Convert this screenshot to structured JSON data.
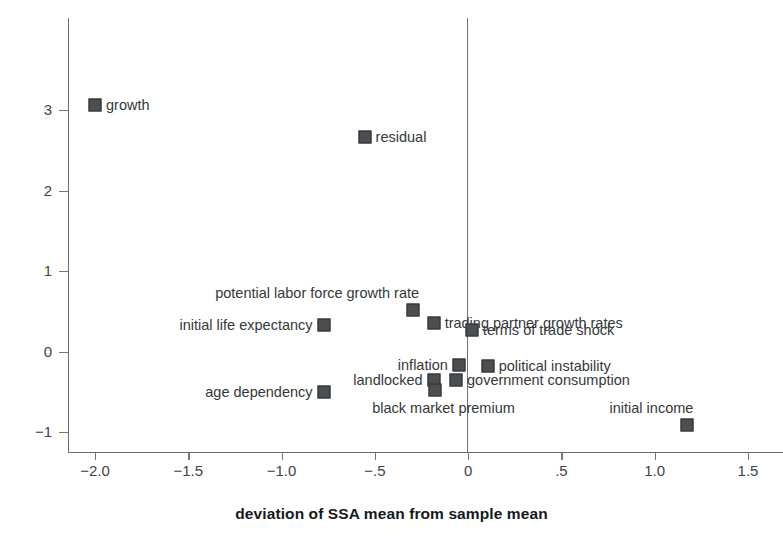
{
  "chart_data": {
    "type": "scatter",
    "title": "",
    "xlabel": "deviation of SSA mean from sample mean",
    "ylabel": "",
    "xlim": [
      -2.2,
      1.6
    ],
    "ylim": [
      -1.35,
      3.45
    ],
    "grid": false,
    "legend": "none",
    "xticks": [
      -2.0,
      -1.5,
      -1.0,
      -0.5,
      0,
      0.5,
      1.0,
      1.5
    ],
    "xticklabels": [
      "-2.0",
      "-1.5",
      "-1.0",
      "-.5",
      "0",
      ".5",
      "1.0",
      "1.5"
    ],
    "yticks": [
      3,
      2,
      1,
      0,
      -1
    ],
    "yticklabels": [
      "3",
      "2",
      "1",
      "0",
      "-1"
    ],
    "marker_color": "#4b4f52",
    "marker_edge_color": "#2e3133",
    "axis_color": "#666b6e",
    "text_color": "#34383b",
    "points": [
      {
        "label": "growth",
        "x": -2.0,
        "y": 3.06,
        "label_pos": "right"
      },
      {
        "label": "residual",
        "x": -0.555,
        "y": 2.66,
        "label_pos": "right"
      },
      {
        "label": "potential labor force growth rate",
        "x": -0.295,
        "y": 0.52,
        "label_pos": "above-left"
      },
      {
        "label": "initial life expectancy",
        "x": -0.775,
        "y": 0.33,
        "label_pos": "left"
      },
      {
        "label": "trading partner growth rates",
        "x": -0.185,
        "y": 0.355,
        "label_pos": "right"
      },
      {
        "label": "terms of trade shock",
        "x": 0.02,
        "y": 0.265,
        "label_pos": "right"
      },
      {
        "label": "inflation",
        "x": -0.05,
        "y": -0.17,
        "label_pos": "left"
      },
      {
        "label": "political instability",
        "x": 0.105,
        "y": -0.175,
        "label_pos": "right"
      },
      {
        "label": "landlocked",
        "x": -0.185,
        "y": -0.355,
        "label_pos": "left"
      },
      {
        "label": "government consumption",
        "x": -0.065,
        "y": -0.36,
        "label_pos": "right"
      },
      {
        "label": "black market premium",
        "x": -0.175,
        "y": -0.48,
        "label_pos": "below-right"
      },
      {
        "label": "age dependency",
        "x": -0.775,
        "y": -0.5,
        "label_pos": "left"
      },
      {
        "label": "initial income",
        "x": 1.175,
        "y": -0.91,
        "label_pos": "above-left"
      }
    ]
  }
}
